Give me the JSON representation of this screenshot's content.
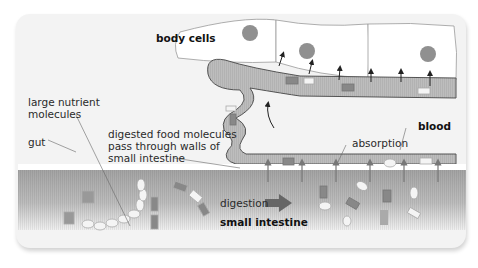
{
  "figure": {
    "labels": {
      "body_cells": "body cells",
      "large_nutrient_molecules_line1": "large nutrient",
      "large_nutrient_molecules_line2": "molecules",
      "gut": "gut",
      "digested_line1": "digested food molecules",
      "digested_line2": "pass through walls of",
      "digested_line3": "small intestine",
      "blood": "blood",
      "absorption": "absorption",
      "digestion": "digestion",
      "small_intestine": "small intestine"
    },
    "colors": {
      "background": "#f3f3f3",
      "cell_fill": "#ffffff",
      "nucleus": "#909090",
      "blood_vessel": "#bdbdbd",
      "intestine_dark": "#a8a8a8",
      "molecule_dark": "#7a7a7a",
      "molecule_light": "#f4f4f4",
      "arrow": "#222222"
    }
  }
}
